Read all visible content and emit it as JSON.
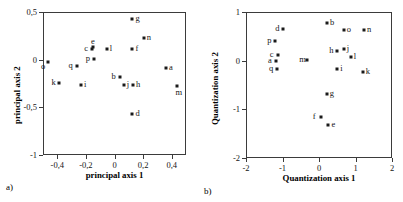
{
  "figure": {
    "background_color": "#ffffff",
    "point_color": "#1a1a1a",
    "axis_color": "#3b3b3b"
  },
  "panels": [
    {
      "caption": "a)",
      "caption_x": 6,
      "caption_y": 182
    },
    {
      "caption": "b)",
      "caption_x": 8,
      "caption_y": 186
    }
  ],
  "chart_data": [
    {
      "type": "scatter",
      "title": "",
      "panel_label": "a)",
      "xlabel": "principal axis 1",
      "ylabel": "principal axis 2",
      "xlim": [
        -0.5,
        0.5
      ],
      "ylim": [
        -1,
        0.5
      ],
      "xticks": [
        -0.4,
        -0.2,
        0,
        0.2,
        0.4
      ],
      "xticklabels": [
        "-0,4",
        "-0,2",
        "0",
        "0,2",
        "0,4"
      ],
      "yticks": [
        0.5,
        0,
        -0.5,
        -1
      ],
      "yticklabels": [
        "0,5",
        "0",
        "-0,5",
        "-1"
      ],
      "grid": false,
      "legend": "none",
      "point_labels_shown": true,
      "points": [
        {
          "label": "a",
          "x": 0.36,
          "y": -0.09,
          "label_side": "right"
        },
        {
          "label": "b",
          "x": 0.035,
          "y": -0.185,
          "label_side": "left"
        },
        {
          "label": "c",
          "x": -0.155,
          "y": 0.115,
          "label_side": "left"
        },
        {
          "label": "d",
          "x": 0.125,
          "y": -0.575,
          "label_side": "right"
        },
        {
          "label": "e",
          "x": -0.15,
          "y": 0.13,
          "label_side": "top"
        },
        {
          "label": "f",
          "x": 0.125,
          "y": 0.11,
          "label_side": "right"
        },
        {
          "label": "g",
          "x": 0.125,
          "y": 0.425,
          "label_side": "right"
        },
        {
          "label": "h",
          "x": 0.13,
          "y": -0.265,
          "label_side": "right"
        },
        {
          "label": "i",
          "x": -0.235,
          "y": -0.27,
          "label_side": "right"
        },
        {
          "label": "j",
          "x": 0.065,
          "y": -0.27,
          "label_side": "right"
        },
        {
          "label": "k",
          "x": -0.385,
          "y": -0.245,
          "label_side": "left"
        },
        {
          "label": "l",
          "x": -0.055,
          "y": 0.115,
          "label_side": "right"
        },
        {
          "label": "m",
          "x": 0.44,
          "y": -0.275,
          "label_side": "bottom"
        },
        {
          "label": "n",
          "x": 0.205,
          "y": 0.225,
          "label_side": "right"
        },
        {
          "label": "o",
          "x": -0.465,
          "y": -0.025,
          "label_side": "bottom-left"
        },
        {
          "label": "p",
          "x": -0.145,
          "y": 0.005,
          "label_side": "left"
        },
        {
          "label": "q",
          "x": -0.265,
          "y": -0.065,
          "label_side": "left"
        }
      ]
    },
    {
      "type": "scatter",
      "title": "",
      "panel_label": "b)",
      "xlabel": "Quantization axis 1",
      "ylabel": "Quantization axis 2",
      "xlim": [
        -2,
        2
      ],
      "ylim": [
        -2,
        1
      ],
      "xticks": [
        -2,
        -1,
        0,
        1,
        2
      ],
      "xticklabels": [
        "-2",
        "-1",
        "0",
        "1",
        "2"
      ],
      "yticks": [
        1,
        0,
        -1,
        -2
      ],
      "yticklabels": [
        "1",
        "0",
        "-1",
        "-2"
      ],
      "grid": false,
      "legend": "none",
      "point_labels_shown": true,
      "points": [
        {
          "label": "a",
          "x": -1.18,
          "y": -0.01,
          "label_side": "left"
        },
        {
          "label": "b",
          "x": 0.22,
          "y": 0.78,
          "label_side": "right"
        },
        {
          "label": "c",
          "x": -1.13,
          "y": 0.12,
          "label_side": "left"
        },
        {
          "label": "d",
          "x": -0.98,
          "y": 0.66,
          "label_side": "left"
        },
        {
          "label": "e",
          "x": 0.26,
          "y": -1.32,
          "label_side": "right"
        },
        {
          "label": "f",
          "x": 0.05,
          "y": -1.15,
          "label_side": "left"
        },
        {
          "label": "g",
          "x": 0.21,
          "y": -0.69,
          "label_side": "right"
        },
        {
          "label": "h",
          "x": 0.5,
          "y": 0.2,
          "label_side": "left"
        },
        {
          "label": "i",
          "x": 0.5,
          "y": -0.17,
          "label_side": "right"
        },
        {
          "label": "j",
          "x": 0.68,
          "y": 0.25,
          "label_side": "right"
        },
        {
          "label": "k",
          "x": 1.2,
          "y": -0.23,
          "label_side": "right"
        },
        {
          "label": "l",
          "x": 0.87,
          "y": 0.07,
          "label_side": "right"
        },
        {
          "label": "m",
          "x": -0.32,
          "y": 0.02,
          "label_side": "left"
        },
        {
          "label": "n",
          "x": 1.23,
          "y": 0.63,
          "label_side": "right"
        },
        {
          "label": "o",
          "x": 0.68,
          "y": 0.63,
          "label_side": "right"
        },
        {
          "label": "p",
          "x": -1.2,
          "y": 0.4,
          "label_side": "left"
        },
        {
          "label": "q",
          "x": -1.15,
          "y": -0.17,
          "label_side": "left"
        }
      ]
    }
  ]
}
